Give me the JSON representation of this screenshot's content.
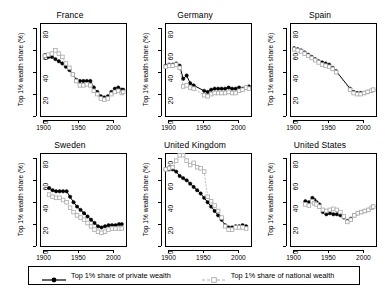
{
  "figure": {
    "axis_label_y": "Top 1% wealth share (%)",
    "x_ticks": [
      1900,
      1950,
      2000
    ],
    "y_ticks": [
      0,
      20,
      40,
      60,
      80
    ],
    "xlim": [
      1895,
      2018
    ],
    "ylim": [
      0,
      85
    ],
    "colors": {
      "private": "#000000",
      "national": "#a8a8a8",
      "axis": "#000000",
      "background": "#ffffff"
    }
  },
  "legend": {
    "entries": [
      {
        "label": "Top 1% share of private wealth",
        "marker": "filled-circle",
        "line": "solid",
        "color": "#000000"
      },
      {
        "label": "Top 1% share of national wealth",
        "marker": "open-square",
        "line": "dashed",
        "color": "#a8a8a8"
      }
    ]
  },
  "chart_data": {
    "type": "line",
    "title": "",
    "xlabel": "",
    "ylabel": "Top 1% wealth share (%)",
    "xlim": [
      1895,
      2018
    ],
    "ylim": [
      0,
      85
    ],
    "grid": false,
    "legend_position": "bottom",
    "panels": [
      {
        "title": "France",
        "series": [
          {
            "name": "Top 1% share of private wealth",
            "marker": "filled-circle",
            "line": "solid",
            "x": [
              1902,
              1907,
              1912,
              1917,
              1922,
              1927,
              1932,
              1937,
              1942,
              1947,
              1952,
              1957,
              1962,
              1967,
              1972,
              1977,
              1982,
              1987,
              1992,
              1997,
              2002,
              2007,
              2012,
              2014
            ],
            "values": [
              55,
              54,
              54,
              52,
              50,
              48,
              45,
              42,
              38,
              33,
              32,
              32,
              32,
              32,
              26,
              22,
              18,
              17,
              18,
              22,
              25,
              26,
              24,
              24
            ]
          },
          {
            "name": "Top 1% share of national wealth",
            "marker": "open-square",
            "line": "dashed",
            "x": [
              1902,
              1907,
              1912,
              1917,
              1922,
              1927,
              1932,
              1937,
              1942,
              1947,
              1952,
              1957,
              1962,
              1967,
              1972,
              1977,
              1982,
              1987,
              1992,
              1997,
              2002,
              2007,
              2012,
              2014
            ],
            "values": [
              55,
              56,
              57,
              60,
              57,
              54,
              48,
              44,
              38,
              32,
              28,
              28,
              29,
              28,
              23,
              20,
              16,
              15,
              16,
              20,
              22,
              23,
              21,
              22
            ]
          }
        ]
      },
      {
        "title": "Germany",
        "series": [
          {
            "name": "Top 1% share of private wealth",
            "marker": "filled-circle",
            "line": "solid",
            "x": [
              1896,
              1901,
              1906,
              1911,
              1916,
              1921,
              1926,
              1931,
              1936,
              1951,
              1956,
              1961,
              1966,
              1971,
              1976,
              1981,
              1986,
              1991,
              1996,
              2001,
              2006,
              2011,
              2015
            ],
            "values": [
              46,
              47,
              47,
              48,
              46,
              34,
              37,
              30,
              28,
              23,
              22,
              24,
              25,
              25,
              25,
              25,
              26,
              25,
              25,
              26,
              25,
              26,
              27
            ]
          },
          {
            "name": "Top 1% share of national wealth",
            "marker": "open-square",
            "line": "dashed",
            "x": [
              1896,
              1901,
              1906,
              1911,
              1916,
              1921,
              1926,
              1931,
              1936,
              1951,
              1956,
              1961,
              1966,
              1971,
              1976,
              1981,
              1986,
              1991,
              1996,
              2001,
              2006,
              2011,
              2015
            ],
            "values": [
              45,
              46,
              46,
              47,
              44,
              27,
              28,
              26,
              25,
              19,
              18,
              20,
              21,
              21,
              21,
              21,
              22,
              21,
              21,
              23,
              24,
              26,
              25
            ]
          }
        ]
      },
      {
        "title": "Spain",
        "series": [
          {
            "name": "Top 1% share of private wealth",
            "marker": "filled-circle",
            "line": "solid",
            "x": [
              1901,
              1906,
              1911,
              1916,
              1921,
              1926,
              1931,
              1936,
              1941,
              1946,
              1951,
              1956,
              1961,
              1981,
              1986,
              1991,
              1996,
              2001,
              2006,
              2011,
              2014
            ],
            "values": [
              62,
              61,
              60,
              58,
              56,
              54,
              52,
              50,
              49,
              48,
              47,
              44,
              41,
              25,
              22,
              21,
              21,
              21,
              22,
              23,
              24
            ]
          },
          {
            "name": "Top 1% share of national wealth",
            "marker": "open-square",
            "line": "dashed",
            "x": [
              1901,
              1906,
              1911,
              1916,
              1921,
              1926,
              1931,
              1936,
              1941,
              1946,
              1951,
              1956,
              1961,
              1981,
              1986,
              1991,
              1996,
              2001,
              2006,
              2011,
              2014
            ],
            "values": [
              61,
              60,
              59,
              57,
              55,
              53,
              51,
              49,
              47,
              46,
              45,
              43,
              40,
              24,
              21,
              20,
              20,
              21,
              22,
              23,
              24
            ]
          }
        ]
      },
      {
        "title": "Sweden",
        "series": [
          {
            "name": "Top 1% share of private wealth",
            "marker": "filled-circle",
            "line": "solid",
            "x": [
              1908,
              1913,
              1918,
              1923,
              1928,
              1933,
              1938,
              1943,
              1948,
              1953,
              1958,
              1963,
              1968,
              1973,
              1978,
              1983,
              1988,
              1993,
              1998,
              2003,
              2008,
              2012
            ],
            "values": [
              53,
              51,
              50,
              50,
              50,
              50,
              45,
              40,
              36,
              33,
              30,
              27,
              24,
              21,
              18,
              17,
              18,
              19,
              19,
              19,
              20,
              20
            ]
          },
          {
            "name": "Top 1% share of national wealth",
            "marker": "open-square",
            "line": "dashed",
            "x": [
              1908,
              1913,
              1918,
              1923,
              1928,
              1933,
              1938,
              1943,
              1948,
              1953,
              1958,
              1963,
              1968,
              1973,
              1978,
              1983,
              1988,
              1993,
              1998,
              2003,
              2008,
              2012
            ],
            "values": [
              47,
              45,
              44,
              44,
              42,
              40,
              35,
              31,
              28,
              26,
              24,
              21,
              18,
              15,
              13,
              12,
              13,
              15,
              16,
              16,
              16,
              16
            ]
          }
        ]
      },
      {
        "title": "United Kingdom",
        "series": [
          {
            "name": "Top 1% share of private wealth",
            "marker": "filled-circle",
            "line": "solid",
            "x": [
              1896,
              1901,
              1906,
              1911,
              1916,
              1921,
              1926,
              1931,
              1936,
              1941,
              1946,
              1951,
              1956,
              1961,
              1966,
              1971,
              1976,
              1981,
              1986,
              1991,
              1996,
              2001,
              2006,
              2011
            ],
            "values": [
              70,
              70,
              70,
              68,
              64,
              62,
              60,
              57,
              54,
              51,
              48,
              44,
              40,
              36,
              32,
              28,
              24,
              19,
              17,
              17,
              18,
              18,
              19,
              18
            ]
          },
          {
            "name": "Top 1% share of national wealth",
            "marker": "open-square",
            "line": "dashed",
            "x": [
              1896,
              1901,
              1906,
              1911,
              1916,
              1921,
              1926,
              1931,
              1936,
              1941,
              1946,
              1951,
              1956,
              1961,
              1966,
              1971,
              1976,
              1981,
              1986,
              1991,
              1996,
              2001,
              2006,
              2011
            ],
            "values": [
              70,
              71,
              72,
              78,
              83,
              83,
              78,
              74,
              76,
              72,
              71,
              68,
              45,
              41,
              37,
              32,
              26,
              18,
              15,
              15,
              17,
              17,
              17,
              16
            ]
          }
        ]
      },
      {
        "title": "United States",
        "series": [
          {
            "name": "Top 1% share of private wealth",
            "marker": "filled-circle",
            "line": "none",
            "x": [
              1917,
              1922,
              1927,
              1930,
              1933,
              1937,
              1942,
              1947,
              1952,
              1957,
              1962,
              1967,
              1972,
              1977,
              1982,
              1987,
              1992,
              1997,
              2002,
              2007,
              2012,
              2014
            ],
            "values": [
              41,
              40,
              44,
              42,
              40,
              38,
              31,
              29,
              30,
              29,
              29,
              28,
              26,
              23,
              25,
              28,
              30,
              31,
              32,
              33,
              35,
              36
            ]
          },
          {
            "name": "Top 1% share of national wealth",
            "marker": "open-square",
            "line": "none",
            "x": [
              1917,
              1922,
              1927,
              1930,
              1933,
              1937,
              1942,
              1947,
              1952,
              1957,
              1962,
              1967,
              1972,
              1977,
              1982,
              1987,
              1992,
              1997,
              2002,
              2007,
              2012,
              2014
            ],
            "values": [
              38,
              37,
              41,
              39,
              38,
              36,
              33,
              32,
              33,
              34,
              33,
              31,
              27,
              22,
              24,
              28,
              30,
              31,
              32,
              33,
              35,
              36
            ]
          }
        ]
      }
    ]
  }
}
